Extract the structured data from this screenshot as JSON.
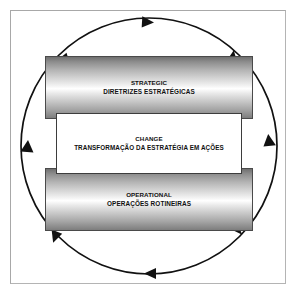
{
  "diagram": {
    "type": "cycle-diagram",
    "frame_color": "#b4b4b4",
    "arrow_color": "#111111",
    "cycle_direction": "clockwise",
    "arrowhead_count": 8,
    "bands": [
      {
        "id": "strategic",
        "style": "cylinder",
        "line_en": "STRATEGIC",
        "line_pt": "DIRETRIZES ESTRATÉGICAS",
        "fill": "gradient-gray",
        "border_color": "#4a4a4a"
      },
      {
        "id": "change",
        "style": "box",
        "line_en": "CHANGE",
        "line_pt": "TRANSFORMAÇÃO DA ESTRATÉGIA EM AÇÕES",
        "fill": "#ffffff",
        "border_color": "#3d3d3d"
      },
      {
        "id": "operational",
        "style": "cylinder",
        "line_en": "OPERATIONAL",
        "line_pt": "OPERAÇÕES ROTINEIRAS",
        "fill": "gradient-gray",
        "border_color": "#4a4a4a"
      }
    ]
  }
}
